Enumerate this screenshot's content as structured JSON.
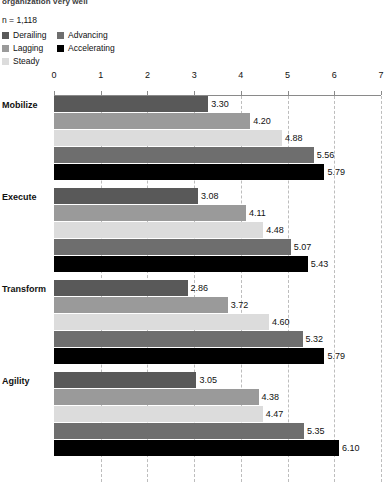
{
  "header": {
    "note": "organization very well",
    "sample_size": "n = 1,118"
  },
  "legend": {
    "columns": [
      {
        "items": [
          {
            "label": "Derailing",
            "color": "#595959",
            "swatch_name": "legend-swatch-derailing"
          },
          {
            "label": "Lagging",
            "color": "#9a9a9a",
            "swatch_name": "legend-swatch-lagging"
          },
          {
            "label": "Steady",
            "color": "#dcdcdc",
            "swatch_name": "legend-swatch-steady"
          }
        ]
      },
      {
        "items": [
          {
            "label": "Advancing",
            "color": "#6e6e6e",
            "swatch_name": "legend-swatch-advancing"
          },
          {
            "label": "Accelerating",
            "color": "#000000",
            "swatch_name": "legend-swatch-accelerating"
          }
        ]
      }
    ]
  },
  "chart_data": {
    "type": "bar",
    "orientation": "horizontal",
    "title": "",
    "subtitle": "organization very well",
    "xlabel": "",
    "ylabel": "",
    "xlim": [
      0,
      7
    ],
    "xticks": [
      0,
      1,
      2,
      3,
      4,
      5,
      6,
      7
    ],
    "xtick_labels": [
      "0",
      "1",
      "2",
      "3",
      "4",
      "5",
      "6",
      "7"
    ],
    "grid": true,
    "grid_style": "dashed-vertical",
    "legend_position": "top-left",
    "sample_size": "n = 1,118",
    "categories": [
      "Mobilize",
      "Execute",
      "Transform",
      "Agility"
    ],
    "series": [
      {
        "name": "Derailing",
        "color": "#595959",
        "values": [
          3.3,
          3.08,
          2.86,
          3.05
        ],
        "labels": [
          "3.30",
          "3.08",
          "2.86",
          "3.05"
        ]
      },
      {
        "name": "Lagging",
        "color": "#9a9a9a",
        "values": [
          4.2,
          4.11,
          3.72,
          4.38
        ],
        "labels": [
          "4.20",
          "4.11",
          "3.72",
          "4.38"
        ]
      },
      {
        "name": "Steady",
        "color": "#dcdcdc",
        "values": [
          4.88,
          4.48,
          4.6,
          4.47
        ],
        "labels": [
          "4.88",
          "4.48",
          "4.60",
          "4.47"
        ]
      },
      {
        "name": "Advancing",
        "color": "#6e6e6e",
        "values": [
          5.56,
          5.07,
          5.32,
          5.35
        ],
        "labels": [
          "5.56",
          "5.07",
          "5.32",
          "5.35"
        ]
      },
      {
        "name": "Accelerating",
        "color": "#000000",
        "values": [
          5.79,
          5.43,
          5.79,
          6.1
        ],
        "labels": [
          "5.79",
          "5.43",
          "5.79",
          "6.10"
        ]
      }
    ]
  }
}
